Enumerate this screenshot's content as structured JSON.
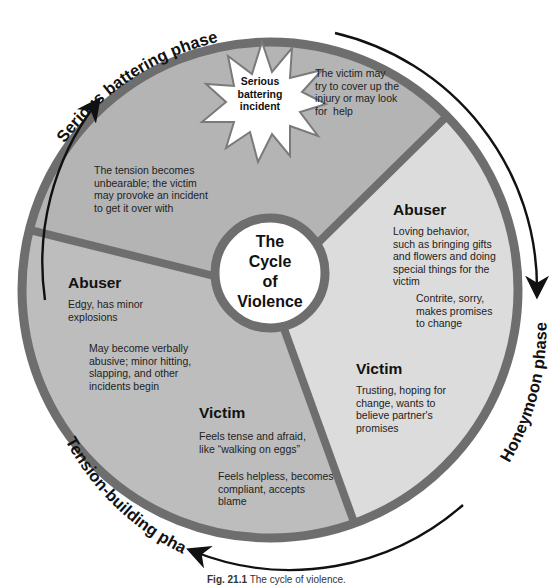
{
  "title": "The Cycle of Violence",
  "center": {
    "lines": [
      "The",
      "Cycle",
      "of",
      "Violence"
    ]
  },
  "phases": [
    {
      "name": "Serious battering phase"
    },
    {
      "name": "Honeymoon phase"
    },
    {
      "name": "Tension-building phase"
    }
  ],
  "serious_battering": {
    "incident_lines": [
      "Serious",
      "battering",
      "incident"
    ],
    "victim_cover": "The victim may try to cover up the injury or may look for help",
    "victim_cover_lines": [
      "The victim may",
      "try to cover up the",
      "injury or may look",
      "for  help"
    ],
    "tension_lines": [
      "The tension becomes",
      "unbearable; the victim",
      "may provoke an incident",
      "to get it over with"
    ]
  },
  "honeymoon": {
    "abuser_heading": "Abuser",
    "abuser_lines": [
      "Loving behavior,",
      "such as bringing gifts",
      "and flowers and doing",
      "special things for the",
      "victim"
    ],
    "abuser2_lines": [
      "Contrite, sorry,",
      "makes promises",
      "to change"
    ],
    "victim_heading": "Victim",
    "victim_lines": [
      "Trusting, hoping for",
      "change, wants to",
      "believe partner's",
      "promises"
    ]
  },
  "tension_building": {
    "abuser_heading": "Abuser",
    "abuser_lines": [
      "Edgy, has minor",
      "explosions"
    ],
    "abuser2_lines": [
      "May become verbally",
      "abusive; minor hitting,",
      "slapping, and other",
      "incidents begin"
    ],
    "victim_heading": "Victim",
    "victim_lines": [
      "Feels tense and afraid,",
      "like “walking on eggs”"
    ],
    "victim2_lines": [
      "Feels helpless, becomes",
      "compliant, accepts",
      "blame"
    ]
  },
  "caption": {
    "label": "Fig. 21.1",
    "text": "The cycle of violence."
  },
  "colors": {
    "serious_segment": "#b4b4b4",
    "honeymoon_segment": "#dcdcdc",
    "tension_segment": "#bdbdbd",
    "rim": "#6e6e6e",
    "arrow": "#111111"
  }
}
